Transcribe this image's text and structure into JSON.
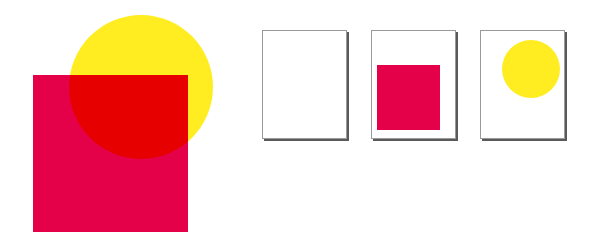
{
  "composite": {
    "square": {
      "x": 33,
      "y": 75,
      "w": 155,
      "h": 157,
      "color": "#e5004a"
    },
    "circle": {
      "cx": 141,
      "cy": 87,
      "r": 72,
      "color": "#ffed21"
    },
    "overlap_color": "#e60000"
  },
  "separations": [
    {
      "name": "page-blank",
      "x": 262,
      "y": 30,
      "w": 85,
      "h": 109
    },
    {
      "name": "page-square",
      "x": 371,
      "y": 30,
      "w": 85,
      "h": 109,
      "square": {
        "x": 376,
        "y": 64,
        "w": 63,
        "h": 65,
        "color": "#e5004a"
      }
    },
    {
      "name": "page-circle",
      "x": 480,
      "y": 30,
      "w": 85,
      "h": 109,
      "circle": {
        "cx": 530,
        "cy": 68,
        "r": 29,
        "color": "#ffed21"
      }
    }
  ]
}
